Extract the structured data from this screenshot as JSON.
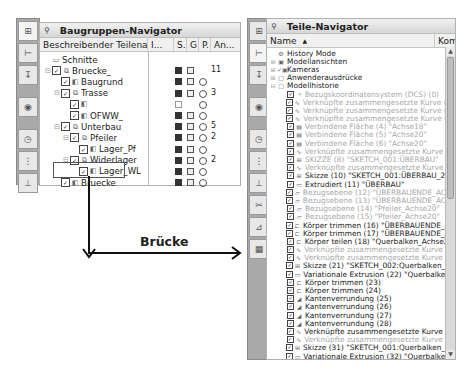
{
  "left_panel": {
    "title": "Baugruppen-Navigator",
    "pin_icon": "pin-icon",
    "columns": [
      "Beschreibender Teilename",
      "I...",
      "S.",
      "G",
      "P.",
      "An..."
    ],
    "rows": [
      {
        "indent": 0,
        "expander": "",
        "checkbox": false,
        "icon": "folder",
        "label": "Schnitte",
        "s": "",
        "g": "",
        "p": "",
        "an": ""
      },
      {
        "indent": 0,
        "expander": "⊟",
        "checkbox": true,
        "icon": "assembly",
        "label": "Bruecke_",
        "s": "save",
        "g": "grp",
        "p": "",
        "an": "11"
      },
      {
        "indent": 1,
        "expander": "",
        "checkbox": true,
        "icon": "part",
        "label": "Baugrund",
        "s": "save",
        "g": "grp",
        "p": "o",
        "an": ""
      },
      {
        "indent": 1,
        "expander": "⊟",
        "checkbox": true,
        "icon": "assembly",
        "label": "Trasse",
        "s": "save",
        "g": "grp",
        "p": "o",
        "an": "3"
      },
      {
        "indent": 2,
        "expander": "",
        "checkbox": true,
        "icon": "part",
        "label": "",
        "s": "empty",
        "g": "",
        "p": "o",
        "an": ""
      },
      {
        "indent": 2,
        "expander": "",
        "checkbox": true,
        "icon": "part",
        "label": "OFWW_",
        "s": "save",
        "g": "grp",
        "p": "o",
        "an": ""
      },
      {
        "indent": 1,
        "expander": "⊟",
        "checkbox": true,
        "icon": "assembly",
        "label": "Unterbau",
        "s": "save",
        "g": "grp",
        "p": "o",
        "an": "5"
      },
      {
        "indent": 2,
        "expander": "⊟",
        "checkbox": true,
        "icon": "assembly",
        "label": "Pfeiler",
        "s": "save",
        "g": "grp",
        "p": "o",
        "an": "2"
      },
      {
        "indent": 3,
        "expander": "",
        "checkbox": true,
        "icon": "part",
        "label": "Lager_Pf",
        "s": "save",
        "g": "grp",
        "p": "o",
        "an": ""
      },
      {
        "indent": 2,
        "expander": "⊟",
        "checkbox": true,
        "icon": "assembly",
        "label": "Widerlager",
        "s": "save",
        "g": "grp",
        "p": "o",
        "an": "2"
      },
      {
        "indent": 3,
        "expander": "",
        "checkbox": true,
        "icon": "part",
        "label": "Lager_WL",
        "s": "save",
        "g": "grp",
        "p": "o",
        "an": ""
      },
      {
        "indent": 1,
        "expander": "",
        "checkbox": true,
        "icon": "part",
        "label": "Bruecke",
        "s": "save",
        "g": "grp",
        "p": "o",
        "an": ""
      }
    ]
  },
  "annotation": {
    "label": "Brücke"
  },
  "right_panel": {
    "title": "Teile-Navigator",
    "columns": [
      "Name",
      "Kom"
    ],
    "sort_indicator": "▲",
    "rows": [
      {
        "indent": 0,
        "expander": "",
        "icon": "⚙",
        "label": "History Mode",
        "dim": false
      },
      {
        "indent": 0,
        "expander": "⊞",
        "icon": "▣",
        "label": "Modellansichten",
        "dim": false
      },
      {
        "indent": 0,
        "expander": "⊞",
        "icon": "✓▣",
        "label": "Kameras",
        "dim": false
      },
      {
        "indent": 0,
        "expander": "⊞",
        "icon": "▢",
        "label": "Anwenderausdrücke",
        "dim": false
      },
      {
        "indent": 0,
        "expander": "⊟",
        "icon": "▢",
        "label": "Modellhistorie",
        "dim": false
      },
      {
        "indent": 1,
        "expander": "",
        "icon": "⌗",
        "label": "Bezugskoordinatensystem (DCS) (0)",
        "dim": true
      },
      {
        "indent": 1,
        "expander": "",
        "icon": "∿",
        "label": "Verknüpfte zusammengesetzte Kurve (1) \"N...",
        "dim": true
      },
      {
        "indent": 1,
        "expander": "",
        "icon": "∿",
        "label": "Verknüpfte zusammengesetzte Kurve (2) \"A...",
        "dim": true
      },
      {
        "indent": 1,
        "expander": "",
        "icon": "∿",
        "label": "Verknüpfte zusammengesetzte Kurve (3) \"I...",
        "dim": true
      },
      {
        "indent": 1,
        "expander": "",
        "icon": "▤",
        "label": "Verbindene Fläche (4) \"Achse18\"",
        "dim": true
      },
      {
        "indent": 1,
        "expander": "",
        "icon": "▤",
        "label": "Verbindene Fläche (5) \"Achse20\"",
        "dim": true
      },
      {
        "indent": 1,
        "expander": "",
        "icon": "▤",
        "label": "Verbindene Fläche (6) \"Achse20\"",
        "dim": true
      },
      {
        "indent": 1,
        "expander": "",
        "icon": "∿",
        "label": "Verknüpfte zusammengesetzte Kurve (7)",
        "dim": true
      },
      {
        "indent": 1,
        "expander": "",
        "icon": "⊞",
        "label": "SKIZZE (8) \"SKETCH_001:ÜBERBAU\"",
        "dim": true
      },
      {
        "indent": 1,
        "expander": "",
        "icon": "∿",
        "label": "Verknüpfte zusammengesetzte Kurve (9)",
        "dim": true
      },
      {
        "indent": 1,
        "expander": "",
        "icon": "⊞",
        "label": "Skizze (10) \"SKETCH_001:ÜBERBAU_2\"",
        "dim": false
      },
      {
        "indent": 1,
        "expander": "",
        "icon": "▭",
        "label": "Extrudiert (11) \"ÜBERBAU\"",
        "dim": false
      },
      {
        "indent": 1,
        "expander": "",
        "icon": "▱",
        "label": "Bezugsebene (12) \"ÜBERBAUENDE_ACHSE1...",
        "dim": true
      },
      {
        "indent": 1,
        "expander": "",
        "icon": "▱",
        "label": "Bezugsebene (13) \"ÜBERBAUENDE_ACHSE1...",
        "dim": true
      },
      {
        "indent": 1,
        "expander": "",
        "icon": "▱",
        "label": "Bezugsebene (14) \"Pfeiler_Achse20\"",
        "dim": true
      },
      {
        "indent": 1,
        "expander": "",
        "icon": "▱",
        "label": "Bezugsebene (15) \"Pfeiler_Achse20\"",
        "dim": true
      },
      {
        "indent": 1,
        "expander": "",
        "icon": "⊏",
        "label": "Körper trimmen (16) \"ÜBERBAUENDE_ACHS...",
        "dim": false
      },
      {
        "indent": 1,
        "expander": "",
        "icon": "⊏",
        "label": "Körper trimmen (17) \"ÜBERBAUENDE_ACHS...",
        "dim": false
      },
      {
        "indent": 1,
        "expander": "",
        "icon": "⊏",
        "label": "Körper teilen (18) \"Querbalken_Achse20\"",
        "dim": false
      },
      {
        "indent": 1,
        "expander": "",
        "icon": "∿",
        "label": "Verknüpfte zusammengesetzte Kurve (19)",
        "dim": true
      },
      {
        "indent": 1,
        "expander": "",
        "icon": "∿",
        "label": "Verknüpfte zusammengesetzte Kurve (20)",
        "dim": true
      },
      {
        "indent": 1,
        "expander": "",
        "icon": "⊞",
        "label": "Skizze (21) \"SKETCH_002:Querbalken_Achs...",
        "dim": false
      },
      {
        "indent": 1,
        "expander": "",
        "icon": "▭",
        "label": "Variationale Extrusion (22) \"Querbalken_Ac...",
        "dim": false
      },
      {
        "indent": 1,
        "expander": "",
        "icon": "⊏",
        "label": "Körper trimmen (23)",
        "dim": false
      },
      {
        "indent": 1,
        "expander": "",
        "icon": "⊏",
        "label": "Körper trimmen (24)",
        "dim": false
      },
      {
        "indent": 1,
        "expander": "",
        "icon": "◢",
        "label": "Kantenverrundung (25)",
        "dim": false
      },
      {
        "indent": 1,
        "expander": "",
        "icon": "◢",
        "label": "Kantenverrundung (26)",
        "dim": false
      },
      {
        "indent": 1,
        "expander": "",
        "icon": "◢",
        "label": "Kantenverrundung (27)",
        "dim": false
      },
      {
        "indent": 1,
        "expander": "",
        "icon": "◢",
        "label": "Kantenverrundung (28)",
        "dim": false
      },
      {
        "indent": 1,
        "expander": "",
        "icon": "∿",
        "label": "Verknüpfte zusammengesetzte Kurve (29)",
        "dim": false
      },
      {
        "indent": 1,
        "expander": "",
        "icon": "∿",
        "label": "Verknüpfte zusammengesetzte Kurve (30)",
        "dim": true
      },
      {
        "indent": 1,
        "expander": "",
        "icon": "⊞",
        "label": "Skizze (31) \"SKETCH_001:Querbalken_Wide...",
        "dim": false
      },
      {
        "indent": 1,
        "expander": "",
        "icon": "▭",
        "label": "Variationale Extrusion (32) \"Querbalken_Ac...",
        "dim": false
      }
    ]
  },
  "left_toolbar": {
    "buttons": [
      "assembly-navigator-icon",
      "constraint-navigator-icon",
      "part-navigator-icon",
      "reuse-library-icon",
      "history-icon",
      "system-materials-icon",
      "roles-icon"
    ]
  },
  "right_toolbar": {
    "buttons": [
      "assembly-navigator-icon",
      "constraint-navigator-icon",
      "part-navigator-icon",
      "reuse-library-icon",
      "history-icon",
      "system-materials-icon",
      "roles-icon",
      "tools-icon",
      "web-browser-icon",
      "palette-icon"
    ]
  },
  "colors": {
    "toolbar_bg": "#a9a9a9",
    "dim_text": "#a8a8a8",
    "arrow": "#111111"
  }
}
